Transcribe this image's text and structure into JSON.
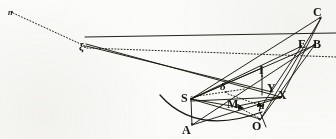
{
  "figure": {
    "kind": "line-diagram",
    "width": 336,
    "height": 139,
    "ink_color": "#17160f",
    "paper_color": "#fbfbf9"
  },
  "labels": [
    {
      "id": "n",
      "text": "n",
      "x": 8,
      "y": 9,
      "size": "sz-xs",
      "style": "lbl"
    },
    {
      "id": "xi",
      "text": "ξ",
      "x": 79,
      "y": 41,
      "size": "sz-md",
      "style": "lbl"
    },
    {
      "id": "C",
      "text": "C",
      "x": 313,
      "y": 6,
      "size": "sz-lg",
      "style": "lbl up"
    },
    {
      "id": "E",
      "text": "E",
      "x": 298,
      "y": 38,
      "size": "sz-lg",
      "style": "lbl up"
    },
    {
      "id": "B",
      "text": "B",
      "x": 313,
      "y": 38,
      "size": "sz-lg",
      "style": "lbl up"
    },
    {
      "id": "I",
      "text": "I",
      "x": 259,
      "y": 64,
      "size": "sz-lg",
      "style": "lbl up"
    },
    {
      "id": "Y",
      "text": "Y",
      "x": 267,
      "y": 82,
      "size": "sz-lg",
      "style": "lbl up"
    },
    {
      "id": "X",
      "text": "X",
      "x": 278,
      "y": 89,
      "size": "sz-lg",
      "style": "lbl up"
    },
    {
      "id": "S",
      "text": "S",
      "x": 181,
      "y": 92,
      "size": "sz-lg",
      "style": "lbl up"
    },
    {
      "id": "delta",
      "text": "δ",
      "x": 220,
      "y": 81,
      "size": "sz-md",
      "style": "lbl"
    },
    {
      "id": "M",
      "text": "M",
      "x": 227,
      "y": 98,
      "size": "sz-lg",
      "style": "lbl up"
    },
    {
      "id": "mu",
      "text": "μ",
      "x": 259,
      "y": 101,
      "size": "sz-sm",
      "style": "lbl"
    },
    {
      "id": "A",
      "text": "A",
      "x": 182,
      "y": 124,
      "size": "sz-lg",
      "style": "lbl up"
    },
    {
      "id": "O",
      "text": "O",
      "x": 252,
      "y": 120,
      "size": "sz-lg",
      "style": "lbl up"
    }
  ],
  "points": {
    "n": {
      "x": 12,
      "y": 12
    },
    "xi": {
      "x": 85,
      "y": 47
    },
    "C": {
      "x": 320,
      "y": 18
    },
    "E": {
      "x": 301,
      "y": 46
    },
    "B": {
      "x": 314,
      "y": 45
    },
    "I": {
      "x": 262,
      "y": 76
    },
    "Y": {
      "x": 271,
      "y": 91
    },
    "X": {
      "x": 281,
      "y": 97
    },
    "S": {
      "x": 191,
      "y": 99
    },
    "delta": {
      "x": 226,
      "y": 92
    },
    "M": {
      "x": 238,
      "y": 105
    },
    "mu": {
      "x": 262,
      "y": 106
    },
    "A": {
      "x": 192,
      "y": 124
    },
    "O": {
      "x": 259,
      "y": 119
    }
  },
  "segments": {
    "solid": [
      {
        "name": "xi-to-top-right",
        "d": "M 85 37 L 336 33"
      },
      {
        "name": "xi-to-X",
        "d": "M 86 44 L 281 97"
      },
      {
        "name": "xi-to-Y",
        "d": "M 86 46 L 272 92"
      },
      {
        "name": "S-to-C",
        "d": "M 191 99 L 321 17"
      },
      {
        "name": "S-to-B",
        "d": "M 191 99 L 315 45"
      },
      {
        "name": "S-to-E",
        "d": "M 191 99 L 302 46"
      },
      {
        "name": "S-to-O",
        "d": "M 191 99 L 260 119"
      },
      {
        "name": "S-to-A",
        "d": "M 191 99 L 192 125"
      },
      {
        "name": "S-to-M-arrow",
        "d": "M 191 99 L 243 108"
      },
      {
        "name": "A-to-X",
        "d": "M 192 125 L 282 97"
      },
      {
        "name": "A-to-B",
        "d": "M 192 125 L 314 45"
      },
      {
        "name": "C-to-X",
        "d": "M 321 18 L 281 98"
      },
      {
        "name": "C-to-O",
        "d": "M 321 18 L 260 120"
      },
      {
        "name": "B-to-O",
        "d": "M 314 46 L 260 120"
      },
      {
        "name": "E-to-mu",
        "d": "M 301 47 L 261 107"
      },
      {
        "name": "I-vertical",
        "d": "M 262 68 L 262 95"
      },
      {
        "name": "I-to-S-chord",
        "d": "M 262 68 L 191 99"
      },
      {
        "name": "YX-base",
        "d": "M 191 101 L 281 97"
      },
      {
        "name": "M-to-X",
        "d": "M 238 106 L 281 97"
      },
      {
        "name": "O-tail",
        "d": "M 260 112 L 266 127"
      }
    ],
    "dotted": [
      {
        "name": "n-to-xi",
        "d": "M 13 13 L 85 46"
      },
      {
        "name": "xi-to-right",
        "d": "M 87 48 L 336 57"
      },
      {
        "name": "S-to-delta",
        "d": "M 191 97 L 245 89"
      },
      {
        "name": "delta-to-mu",
        "d": "M 228 94 L 262 106"
      },
      {
        "name": "M-to-O",
        "d": "M 238 107 L 259 118"
      }
    ],
    "curve": [
      {
        "name": "arc-through-A",
        "d": "M 160 95 Q 196 136 262 112"
      }
    ]
  }
}
